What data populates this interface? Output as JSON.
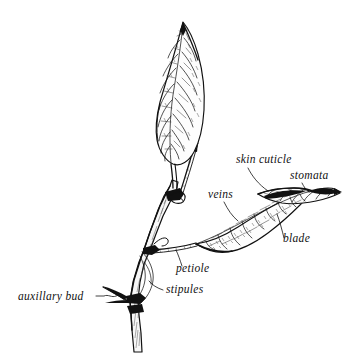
{
  "figure": {
    "style": "pen-and-ink line drawing",
    "background_color": "#ffffff",
    "ink_color": "#111111"
  },
  "labels": [
    {
      "id": "skin-cuticle",
      "text": "skin cuticle",
      "x": 236,
      "y": 163,
      "anchor": "start",
      "points_to": "upper surface of right leaf"
    },
    {
      "id": "stomata",
      "text": "stomata",
      "x": 290,
      "y": 179,
      "anchor": "start",
      "points_to": "leaf surface pores near tip"
    },
    {
      "id": "veins",
      "text": "veins",
      "x": 208,
      "y": 198,
      "anchor": "start",
      "points_to": "vein network of right leaf"
    },
    {
      "id": "blade",
      "text": "blade",
      "x": 283,
      "y": 242,
      "anchor": "start",
      "points_to": "flat lamina of right leaf"
    },
    {
      "id": "petiole",
      "text": "petiole",
      "x": 176,
      "y": 272,
      "anchor": "start",
      "points_to": "leaf stalk joining blade to stem"
    },
    {
      "id": "stipules",
      "text": "stipules",
      "x": 166,
      "y": 293,
      "anchor": "start",
      "points_to": "small appendages at leaf base"
    },
    {
      "id": "auxillary-bud",
      "text": "auxillary bud",
      "x": 18,
      "y": 300,
      "anchor": "start",
      "points_to": "bud in axil at lower node"
    }
  ],
  "parts": [
    {
      "id": "upper-leaf",
      "name": "upper lanceolate leaf"
    },
    {
      "id": "right-leaf",
      "name": "right folded leaf"
    },
    {
      "id": "main-stem",
      "name": "main stem"
    },
    {
      "id": "upper-node",
      "name": "upper stem node"
    },
    {
      "id": "middle-node",
      "name": "middle stem node"
    },
    {
      "id": "lower-node",
      "name": "lower stem node"
    },
    {
      "id": "bare-petiole",
      "name": "bare petiole stub"
    },
    {
      "id": "bud-scale",
      "name": "axillary bud scale"
    }
  ]
}
